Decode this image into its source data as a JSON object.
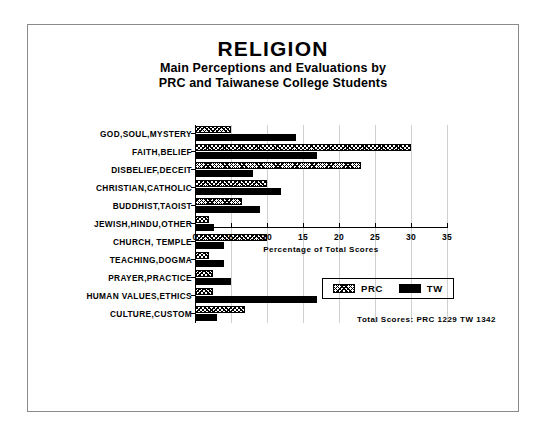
{
  "chart_data": {
    "type": "bar",
    "orientation": "horizontal",
    "title": "RELIGION",
    "subtitle_lines": [
      "Main Perceptions and Evaluations by",
      "PRC and Taiwanese College Students"
    ],
    "xlabel": "Percentage of Total Scores",
    "ylabel": "",
    "xlim": [
      0,
      35
    ],
    "xticks": [
      0,
      5,
      10,
      15,
      20,
      25,
      30,
      35
    ],
    "grid": true,
    "legend_position": "bottom-right",
    "categories": [
      "GOD,SOUL,MYSTERY",
      "FAITH,BELIEF",
      "DISBELIEF,DECEIT",
      "CHRISTIAN,CATHOLIC",
      "BUDDHIST,TAOIST",
      "JEWISH,HINDU,OTHER",
      "CHURCH, TEMPLE",
      "TEACHING,DOGMA",
      "PRAYER,PRACTICE",
      "HUMAN VALUES,ETHICS",
      "CULTURE,CUSTOM"
    ],
    "series": [
      {
        "name": "PRC",
        "pattern": "hatched",
        "values": [
          5.0,
          30.0,
          23.0,
          10.0,
          6.5,
          2.0,
          10.0,
          2.0,
          2.5,
          2.5,
          7.0
        ]
      },
      {
        "name": "TW",
        "pattern": "solid-black",
        "values": [
          14.0,
          17.0,
          8.0,
          12.0,
          9.0,
          2.7,
          4.0,
          4.0,
          5.0,
          17.0,
          3.0
        ]
      }
    ],
    "annotations": {
      "totals": "Total Scores:  PRC 1229  TW 1342"
    }
  }
}
